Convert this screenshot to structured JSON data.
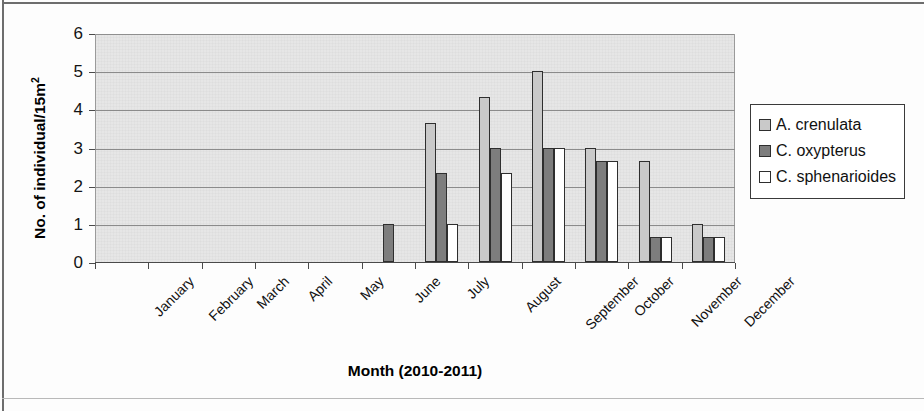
{
  "chart_data": {
    "type": "bar",
    "title": "",
    "xlabel": "Month (2010-2011)",
    "ylabel": "No. of individual/15m2",
    "ylabel_html": "No. of individual/15m<sup>2</sup>",
    "categories": [
      "January",
      "February",
      "March",
      "April",
      "May",
      "June",
      "July",
      "August",
      "September",
      "October",
      "November",
      "December"
    ],
    "series": [
      {
        "name": "A. crenulata",
        "color": "#c9c9c9",
        "values": [
          0,
          0,
          0,
          0,
          0,
          0,
          3.65,
          4.33,
          5.0,
          3.0,
          2.65,
          1.0
        ]
      },
      {
        "name": "C. oxypterus",
        "color": "#7d7d7d",
        "values": [
          0,
          0,
          0,
          0,
          0,
          1.0,
          2.33,
          3.0,
          3.0,
          2.65,
          0.65,
          0.65
        ]
      },
      {
        "name": "C. sphenarioides",
        "color": "#ffffff",
        "values": [
          0,
          0,
          0,
          0,
          0,
          0,
          1.0,
          2.33,
          3.0,
          2.65,
          0.65,
          0.65
        ]
      }
    ],
    "ylim": [
      0,
      6
    ],
    "yticks": [
      0,
      1,
      2,
      3,
      4,
      5,
      6
    ],
    "ytick_labels": [
      "0",
      "1",
      "2",
      "3",
      "4",
      "5",
      "6"
    ],
    "grid": true,
    "grid_axis": "y",
    "legend_position": "right",
    "plot_background": "#e6e6e6",
    "bar_border_color": "#2e2e2e"
  },
  "legend": {
    "entries": [
      {
        "label": "A. crenulata"
      },
      {
        "label": "C. oxypterus"
      },
      {
        "label": "C. sphenarioides"
      }
    ]
  },
  "axes": {
    "x_title": "Month (2010-2011)",
    "y_title_prefix": "No. of individual/15m",
    "y_title_sup": "2"
  }
}
